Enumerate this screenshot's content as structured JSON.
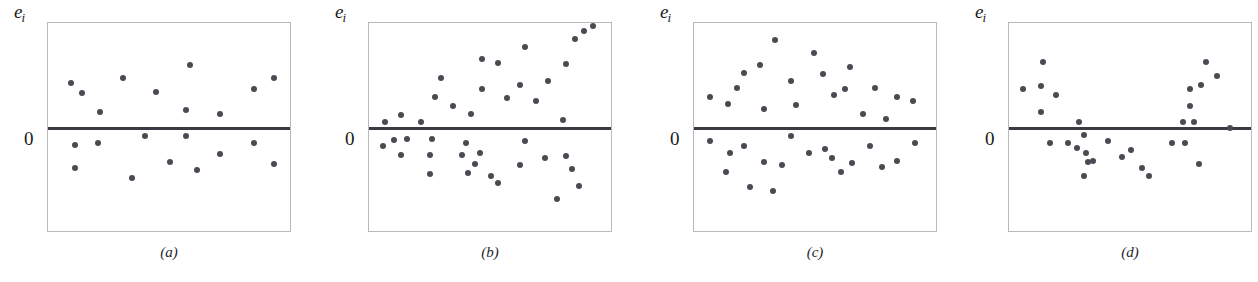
{
  "figure": {
    "background_color": "#ffffff",
    "dot_color": "#4a4a52",
    "frame_color": "#b9b9bd",
    "zero_line_color": "#3a3a42",
    "page_bleed_text": "",
    "panel_geometry": {
      "frame_width": 244,
      "frame_height": 210,
      "frame_top": 22,
      "frame_left": 47,
      "zero_line_y_frac": 0.5
    }
  },
  "chart_data": [
    {
      "type": "scatter",
      "panel_id": "a",
      "caption": "(a)",
      "ylabel": "e_i",
      "ylabel_display": "e",
      "ylabel_sub": "i",
      "zero_tick_label": "0",
      "zero_line": 0.0,
      "xlim": [
        0,
        1
      ],
      "ylim": [
        -1,
        1
      ],
      "grid": false,
      "legend": "none",
      "annotation": "Residuals scattered in a uniform horizontal band around zero (well-behaved model).",
      "x": [
        0.06,
        0.11,
        0.19,
        0.29,
        0.44,
        0.59,
        0.57,
        0.72,
        0.87,
        0.96,
        0.08,
        0.18,
        0.08,
        0.33,
        0.39,
        0.5,
        0.57,
        0.62,
        0.72,
        0.87,
        0.96
      ],
      "y": [
        0.43,
        0.33,
        0.15,
        0.48,
        0.34,
        0.6,
        0.17,
        0.13,
        0.37,
        0.48,
        -0.16,
        -0.14,
        -0.38,
        -0.48,
        -0.08,
        -0.32,
        -0.08,
        -0.4,
        -0.25,
        -0.14,
        -0.34
      ]
    },
    {
      "type": "scatter",
      "panel_id": "b",
      "caption": "(b)",
      "ylabel": "e_i",
      "ylabel_display": "e",
      "ylabel_sub": "i",
      "zero_tick_label": "0",
      "zero_line": 0.0,
      "xlim": [
        0,
        1
      ],
      "ylim": [
        -1,
        1
      ],
      "grid": false,
      "legend": "none",
      "annotation": "Residual spread increases with x (megaphone / fanning-out pattern indicating heteroscedasticity).",
      "x": [
        0.03,
        0.1,
        0.19,
        0.25,
        0.33,
        0.28,
        0.41,
        0.46,
        0.46,
        0.53,
        0.57,
        0.63,
        0.65,
        0.7,
        0.75,
        0.82,
        0.83,
        0.87,
        0.91,
        0.95,
        0.02,
        0.07,
        0.13,
        0.1,
        0.24,
        0.23,
        0.23,
        0.39,
        0.37,
        0.4,
        0.43,
        0.45,
        0.5,
        0.53,
        0.63,
        0.65,
        0.74,
        0.79,
        0.83,
        0.86,
        0.89
      ],
      "y": [
        0.06,
        0.12,
        0.06,
        0.3,
        0.21,
        0.48,
        0.13,
        0.37,
        0.66,
        0.62,
        0.29,
        0.41,
        0.77,
        0.26,
        0.45,
        0.08,
        0.61,
        0.85,
        0.92,
        0.97,
        -0.17,
        -0.11,
        -0.1,
        -0.26,
        -0.1,
        -0.26,
        -0.44,
        -0.14,
        -0.26,
        -0.43,
        -0.34,
        -0.24,
        -0.46,
        -0.52,
        -0.35,
        -0.12,
        -0.29,
        -0.68,
        -0.27,
        -0.39,
        -0.55
      ]
    },
    {
      "type": "scatter",
      "panel_id": "c",
      "caption": "(c)",
      "ylabel": "e_i",
      "ylabel_display": "e",
      "ylabel_sub": "i",
      "zero_tick_label": "0",
      "zero_line": 0.0,
      "xlim": [
        0,
        1
      ],
      "ylim": [
        -1,
        1
      ],
      "grid": false,
      "legend": "none",
      "annotation": "Residual spread is largest in the middle of the x-range and small at both ends (diamond / bow-tie pattern).",
      "x": [
        0.03,
        0.11,
        0.18,
        0.15,
        0.25,
        0.27,
        0.32,
        0.41,
        0.39,
        0.49,
        0.53,
        0.58,
        0.63,
        0.65,
        0.71,
        0.76,
        0.81,
        0.86,
        0.93,
        0.03,
        0.12,
        0.18,
        0.1,
        0.21,
        0.27,
        0.31,
        0.35,
        0.39,
        0.47,
        0.54,
        0.57,
        0.61,
        0.66,
        0.74,
        0.79,
        0.86,
        0.94
      ],
      "y": [
        0.3,
        0.23,
        0.52,
        0.38,
        0.6,
        0.18,
        0.84,
        0.22,
        0.45,
        0.71,
        0.51,
        0.31,
        0.37,
        0.58,
        0.13,
        0.38,
        0.09,
        0.3,
        0.26,
        -0.12,
        -0.24,
        -0.17,
        -0.42,
        -0.56,
        -0.32,
        -0.6,
        -0.35,
        -0.08,
        -0.24,
        -0.2,
        -0.29,
        -0.42,
        -0.33,
        -0.17,
        -0.37,
        -0.31,
        -0.14
      ]
    },
    {
      "type": "scatter",
      "panel_id": "d",
      "caption": "(d)",
      "ylabel": "e_i",
      "ylabel_display": "e",
      "ylabel_sub": "i",
      "zero_tick_label": "0",
      "zero_line": 0.0,
      "xlim": [
        0,
        1
      ],
      "ylim": [
        -1,
        1
      ],
      "grid": false,
      "legend": "none",
      "annotation": "Residuals follow a U-shaped curve: positive at both ends and negative in the middle (omitted curvature / wrong functional form).",
      "x": [
        0.02,
        0.11,
        0.1,
        0.1,
        0.17,
        0.27,
        0.73,
        0.76,
        0.76,
        0.78,
        0.81,
        0.83,
        0.88,
        0.94,
        0.14,
        0.22,
        0.29,
        0.3,
        0.26,
        0.31,
        0.29,
        0.33,
        0.4,
        0.46,
        0.5,
        0.55,
        0.58,
        0.68,
        0.74,
        0.8
      ],
      "y": [
        0.37,
        0.63,
        0.4,
        0.15,
        0.31,
        0.06,
        0.06,
        0.37,
        0.21,
        0.06,
        0.41,
        0.63,
        0.5,
        0.0,
        -0.14,
        -0.14,
        -0.07,
        -0.24,
        -0.19,
        -0.32,
        -0.46,
        -0.31,
        -0.12,
        -0.28,
        -0.21,
        -0.38,
        -0.46,
        -0.14,
        -0.14,
        -0.34
      ]
    }
  ]
}
